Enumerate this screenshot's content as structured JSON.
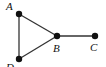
{
  "diagram": {
    "type": "graph",
    "nodes": [
      {
        "id": "A",
        "label": "A",
        "x": 19,
        "y": 14
      },
      {
        "id": "B",
        "label": "B",
        "x": 57,
        "y": 36
      },
      {
        "id": "C",
        "label": "C",
        "x": 95,
        "y": 36
      },
      {
        "id": "D",
        "label": "D",
        "x": 19,
        "y": 59
      }
    ],
    "edges": [
      {
        "from": "A",
        "to": "B"
      },
      {
        "from": "A",
        "to": "D"
      },
      {
        "from": "D",
        "to": "B"
      },
      {
        "from": "B",
        "to": "C"
      }
    ],
    "colors": {
      "node": "#111111",
      "edge": "#333333"
    }
  }
}
